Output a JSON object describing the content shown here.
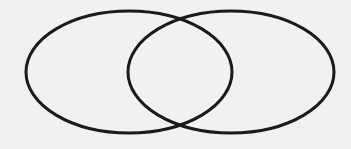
{
  "diagram": {
    "type": "venn",
    "background": "#f1f1f1",
    "stroke_color": "#1a1a1a",
    "stroke_width": 3,
    "sets": [
      {
        "name": "left-set",
        "cx": 129,
        "cy": 72,
        "rx": 103,
        "ry": 61,
        "label": ""
      },
      {
        "name": "right-set",
        "cx": 231,
        "cy": 72,
        "rx": 103,
        "ry": 61,
        "label": ""
      }
    ]
  }
}
